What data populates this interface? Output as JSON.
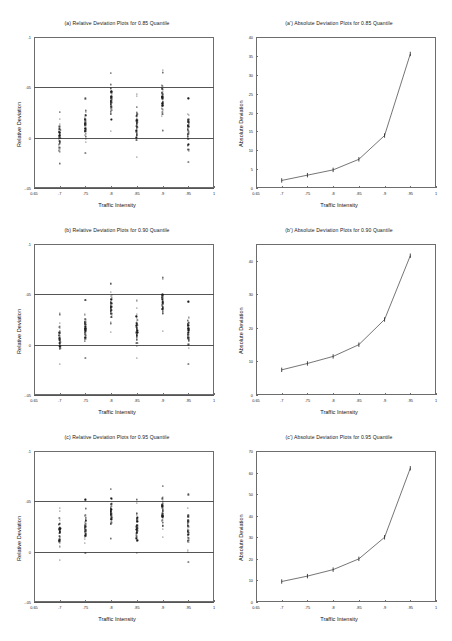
{
  "figure": {
    "background": "#ffffff",
    "axis_color": "#6d6d6d",
    "line_color": "#555555",
    "marker_color": "#1b1b1b"
  },
  "common": {
    "xlabel": "Traffic Intensity",
    "ylabel_relative": "Relative Deviation",
    "ylabel_absolute": "Absolute Deviation",
    "xlim": [
      0.65,
      1.0
    ],
    "xticks": [
      0.65,
      0.7,
      0.75,
      0.8,
      0.85,
      0.9,
      0.95,
      1.0
    ],
    "xticklabels": [
      "0.65",
      ".7",
      ".75",
      ".8",
      ".85",
      ".9",
      ".95",
      "1"
    ],
    "traffic_intensities": [
      0.7,
      0.75,
      0.8,
      0.85,
      0.9,
      0.95
    ]
  },
  "chart_data": [
    {
      "id": "a",
      "type": "scatter",
      "title": "(a) Relative Deviation Plots for 0.85 Quantile",
      "xlabel": "Traffic Intensity",
      "ylabel": "Relative Deviation",
      "xlim": [
        0.65,
        1.0
      ],
      "ylim": [
        -0.05,
        0.1
      ],
      "yticks": [
        -0.05,
        0.0,
        0.05,
        0.1
      ],
      "yticklabels": [
        "-.05",
        "0",
        ".05",
        ".1"
      ],
      "grid": false,
      "reference_lines": [
        0.05,
        0.0,
        -0.05
      ],
      "categories": [
        0.7,
        0.75,
        0.8,
        0.85,
        0.9,
        0.95
      ],
      "series": [
        {
          "name": "0.70",
          "x": 0.7,
          "median": 0.003,
          "low": -0.02,
          "high": 0.021,
          "n": 46
        },
        {
          "name": "0.75",
          "x": 0.75,
          "median": 0.01,
          "low": -0.009,
          "high": 0.034,
          "n": 46
        },
        {
          "name": "0.80",
          "x": 0.8,
          "median": 0.032,
          "low": 0.014,
          "high": 0.057,
          "n": 46
        },
        {
          "name": "0.85",
          "x": 0.85,
          "median": 0.012,
          "low": -0.013,
          "high": 0.036,
          "n": 46
        },
        {
          "name": "0.90",
          "x": 0.9,
          "median": 0.034,
          "low": 0.013,
          "high": 0.06,
          "n": 46
        },
        {
          "name": "0.95",
          "x": 0.95,
          "median": 0.008,
          "low": -0.019,
          "high": 0.033,
          "n": 46
        }
      ]
    },
    {
      "id": "a-prime",
      "type": "line",
      "title": "(a') Absolute Deviation Plots for 0.85 Quantile",
      "xlabel": "Traffic Intensity",
      "ylabel": "Absolute Deviation",
      "xlim": [
        0.65,
        1.0
      ],
      "ylim": [
        0,
        40
      ],
      "yticks": [
        0,
        5,
        10,
        15,
        20,
        25,
        30,
        35,
        40
      ],
      "yticklabels": [
        "0",
        "5",
        "10",
        "15",
        "20",
        "25",
        "30",
        "35",
        "40"
      ],
      "grid": false,
      "x": [
        0.7,
        0.75,
        0.8,
        0.85,
        0.9,
        0.95
      ],
      "values": [
        2.0,
        3.4,
        4.8,
        7.6,
        13.9,
        35.5
      ],
      "marker": "tick"
    },
    {
      "id": "b",
      "type": "scatter",
      "title": "(b) Relative Deviation Plots for 0.90 Quantile",
      "xlabel": "Traffic Intensity",
      "ylabel": "Relative Deviation",
      "xlim": [
        0.65,
        1.0
      ],
      "ylim": [
        -0.05,
        0.1
      ],
      "yticks": [
        -0.05,
        0.0,
        0.05,
        0.1
      ],
      "yticklabels": [
        "-.05",
        "0",
        ".05",
        ".1"
      ],
      "grid": false,
      "reference_lines": [
        0.05,
        0.0,
        -0.05
      ],
      "categories": [
        0.7,
        0.75,
        0.8,
        0.85,
        0.9,
        0.95
      ],
      "series": [
        {
          "name": "0.70",
          "x": 0.7,
          "median": 0.012,
          "low": -0.012,
          "high": 0.026,
          "n": 46
        },
        {
          "name": "0.75",
          "x": 0.75,
          "median": 0.018,
          "low": -0.006,
          "high": 0.037,
          "n": 46
        },
        {
          "name": "0.80",
          "x": 0.8,
          "median": 0.031,
          "low": 0.018,
          "high": 0.056,
          "n": 46
        },
        {
          "name": "0.85",
          "x": 0.85,
          "median": 0.018,
          "low": -0.008,
          "high": 0.038,
          "n": 46
        },
        {
          "name": "0.90",
          "x": 0.9,
          "median": 0.033,
          "low": 0.021,
          "high": 0.06,
          "n": 46
        },
        {
          "name": "0.95",
          "x": 0.95,
          "median": 0.012,
          "low": -0.014,
          "high": 0.038,
          "n": 46
        }
      ]
    },
    {
      "id": "b-prime",
      "type": "line",
      "title": "(b') Absolute Deviation Plots for 0.90 Quantile",
      "xlabel": "Traffic Intensity",
      "ylabel": "Absolute Deviation",
      "xlim": [
        0,
        45
      ],
      "ylim": [
        0,
        45
      ],
      "yticks": [
        0,
        10,
        20,
        30,
        40
      ],
      "yticklabels": [
        "0",
        "10",
        "20",
        "30",
        "40"
      ],
      "grid": false,
      "x": [
        0.7,
        0.75,
        0.8,
        0.85,
        0.9,
        0.95
      ],
      "values": [
        7.5,
        9.4,
        11.5,
        15.0,
        22.5,
        41.5
      ],
      "marker": "tick"
    },
    {
      "id": "c",
      "type": "scatter",
      "title": "(c) Relative Deviation Plots for 0.95 Quantile",
      "xlabel": "Traffic Intensity",
      "ylabel": "Relative Deviation",
      "xlim": [
        0.65,
        1.0
      ],
      "ylim": [
        -0.05,
        0.1
      ],
      "yticks": [
        -0.05,
        0.0,
        0.05,
        0.1
      ],
      "yticklabels": [
        "-.05",
        "0",
        ".05",
        ".1"
      ],
      "grid": false,
      "reference_lines": [
        0.05,
        0.0,
        -0.05
      ],
      "categories": [
        0.7,
        0.75,
        0.8,
        0.85,
        0.9,
        0.95
      ],
      "series": [
        {
          "name": "0.70",
          "x": 0.7,
          "median": 0.022,
          "low": -0.002,
          "high": 0.036,
          "n": 46
        },
        {
          "name": "0.75",
          "x": 0.75,
          "median": 0.028,
          "low": 0.004,
          "high": 0.047,
          "n": 46
        },
        {
          "name": "0.80",
          "x": 0.8,
          "median": 0.038,
          "low": 0.021,
          "high": 0.058,
          "n": 46
        },
        {
          "name": "0.85",
          "x": 0.85,
          "median": 0.028,
          "low": 0.004,
          "high": 0.044,
          "n": 46
        },
        {
          "name": "0.90",
          "x": 0.9,
          "median": 0.038,
          "low": 0.021,
          "high": 0.06,
          "n": 46
        },
        {
          "name": "0.95",
          "x": 0.95,
          "median": 0.022,
          "low": -0.004,
          "high": 0.051,
          "n": 46
        }
      ]
    },
    {
      "id": "c-prime",
      "type": "line",
      "title": "(c') Absolute Deviation Plots for 0.95 Quantile",
      "xlabel": "Traffic Intensity",
      "ylabel": "Absolute Deviation",
      "xlim": [
        0.65,
        1.0
      ],
      "ylim": [
        0,
        70
      ],
      "yticks": [
        0,
        10,
        20,
        30,
        40,
        50,
        60,
        70
      ],
      "yticklabels": [
        "0",
        "10",
        "20",
        "30",
        "40",
        "50",
        "60",
        "70"
      ],
      "grid": false,
      "x": [
        0.7,
        0.75,
        0.8,
        0.85,
        0.9,
        0.95
      ],
      "values": [
        9.5,
        12.0,
        15.0,
        20.0,
        30.0,
        62.0
      ],
      "marker": "tick"
    }
  ]
}
